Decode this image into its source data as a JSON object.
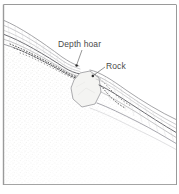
{
  "figure": {
    "width": 179,
    "height": 194,
    "frame_color": "#9a9a9a",
    "background_color": "#ffffff"
  },
  "labels": {
    "depth_hoar": "Depth hoar",
    "rock": "Rock"
  },
  "colors": {
    "snow_layer_line": "#8c8c90",
    "snow_layer_line_dark": "#55555a",
    "depth_hoar_dotted": "#3a3a3a",
    "rock_outline": "#9a9a9a",
    "rock_fill": "#f2f2f0",
    "ground_stipple": "#ebebe9",
    "label_text": "#4a4a4a",
    "leader_line": "#6a6a6a"
  },
  "annotations": [
    {
      "name": "depth-hoar",
      "label": "Depth hoar",
      "label_x": 58,
      "label_y": 40,
      "leader_from": [
        82,
        50
      ],
      "leader_to": [
        76,
        65
      ],
      "marker": [
        76,
        66
      ]
    },
    {
      "name": "rock",
      "label": "Rock",
      "label_x": 106,
      "label_y": 62,
      "leader_from": [
        105,
        67
      ],
      "leader_to": [
        93,
        76
      ],
      "marker": [
        92,
        77
      ]
    }
  ],
  "elements": {
    "snow_layers_upper_left": 5,
    "snow_layers_lower_right": 6,
    "rock_polygon_sides": 7,
    "depth_hoar_dot_rows": 3
  }
}
